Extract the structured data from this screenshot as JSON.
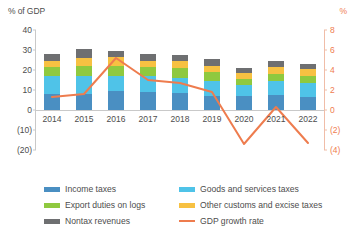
{
  "axes": {
    "left_title": "% of GDP",
    "right_title": "%",
    "left_ticks": [
      "40",
      "30",
      "20",
      "10",
      "0",
      "(10)",
      "(20)"
    ],
    "right_ticks": [
      "8",
      "6",
      "4",
      "2",
      "0",
      "(2)",
      "(4)"
    ]
  },
  "legend": {
    "items": [
      {
        "label": "Income taxes",
        "color": "#4a8fc2",
        "type": "swatch",
        "name": "legend-income-taxes"
      },
      {
        "label": "Export duties on logs",
        "color": "#8fc93f",
        "type": "swatch",
        "name": "legend-export-duties-on-logs"
      },
      {
        "label": "Nontax revenues",
        "color": "#6e6f71",
        "type": "swatch",
        "name": "legend-nontax-revenues"
      },
      {
        "label": "Goods and services taxes",
        "color": "#4fc3e8",
        "type": "swatch",
        "name": "legend-goods-and-services-taxes"
      },
      {
        "label": "Other customs and excise taxes",
        "color": "#f7c142",
        "type": "swatch",
        "name": "legend-other-customs-and-excise-taxes"
      },
      {
        "label": "GDP growth rate",
        "color": "#ee7c4e",
        "type": "line",
        "name": "legend-gdp-growth-rate"
      }
    ]
  },
  "chart_data": {
    "type": "bar",
    "title": "",
    "xlabel": "",
    "ylabel": "% of GDP",
    "y2label": "%",
    "ylim": [
      -20,
      40
    ],
    "y2lim": [
      -4,
      8
    ],
    "grid": false,
    "legend_position": "bottom",
    "categories": [
      "2014",
      "2015",
      "2016",
      "2017",
      "2018",
      "2019",
      "2020",
      "2021",
      "2022"
    ],
    "series": [
      {
        "name": "Income taxes",
        "color": "#4a8fc2",
        "stack": "revenue",
        "values": [
          8.0,
          8.0,
          9.5,
          9.0,
          8.5,
          7.0,
          7.0,
          7.5,
          6.5
        ]
      },
      {
        "name": "Goods and services taxes",
        "color": "#4fc3e8",
        "stack": "revenue",
        "values": [
          9.0,
          9.0,
          7.5,
          8.0,
          7.5,
          7.5,
          5.5,
          7.0,
          7.0
        ]
      },
      {
        "name": "Export duties on logs",
        "color": "#8fc93f",
        "stack": "revenue",
        "values": [
          4.5,
          5.0,
          5.0,
          4.5,
          5.0,
          4.5,
          3.0,
          3.5,
          3.5
        ]
      },
      {
        "name": "Other customs and excise taxes",
        "color": "#f7c142",
        "stack": "revenue",
        "values": [
          3.0,
          4.0,
          4.5,
          3.0,
          3.5,
          3.0,
          3.0,
          3.5,
          3.5
        ]
      },
      {
        "name": "Nontax revenues",
        "color": "#6e6f71",
        "stack": "revenue",
        "values": [
          3.5,
          4.5,
          3.0,
          3.5,
          3.0,
          3.5,
          2.5,
          3.0,
          2.5
        ]
      },
      {
        "name": "GDP growth rate",
        "color": "#ee7c4e",
        "type": "line",
        "axis": "right",
        "values": [
          1.3,
          1.6,
          5.2,
          3.0,
          2.7,
          1.8,
          -3.4,
          0.3,
          -3.3
        ]
      }
    ],
    "totals": [
      28.0,
      30.5,
      29.5,
      28.0,
      27.5,
      25.5,
      21.0,
      24.5,
      23.0
    ]
  }
}
